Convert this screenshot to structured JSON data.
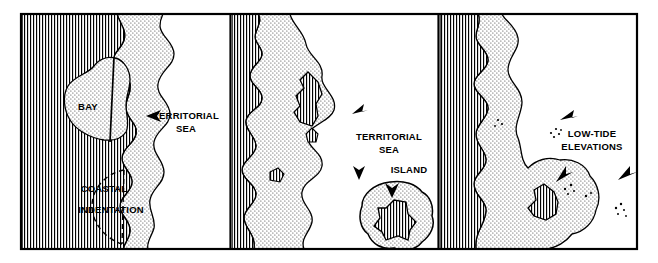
{
  "figure": {
    "frame": {
      "x": 20,
      "y": 13,
      "width": 618,
      "height": 237,
      "border_color": "#000000",
      "border_width": 2
    },
    "dividers": [
      230,
      438
    ],
    "colors": {
      "land_hatch": "#000000",
      "land_fill": "#ffffff",
      "sea_stipple": "#000000",
      "sea_fill": "#ffffff",
      "outline": "#000000",
      "arrow": "#000000",
      "background": "#ffffff"
    },
    "patterns": {
      "land": "vertical-line-hatch",
      "territorial_sea": "fine-dot-stipple",
      "open_water": "blank-white"
    }
  },
  "panels": [
    {
      "id": "panel-bay",
      "index": 1,
      "x": 22,
      "width": 208,
      "labels": [
        {
          "name": "bay-label",
          "text": "BAY",
          "x": 88,
          "y": 107,
          "anchor": "middle",
          "size": 9
        },
        {
          "name": "territorial-sea-label-line1",
          "text": "TERRITORIAL",
          "x": 186,
          "y": 119,
          "anchor": "middle",
          "size": 9
        },
        {
          "name": "territorial-sea-label-line2",
          "text": "SEA",
          "x": 186,
          "y": 133,
          "anchor": "middle",
          "size": 9
        },
        {
          "name": "coastal-indentation-label-line1",
          "text": "COASTAL",
          "x": 104,
          "y": 191,
          "anchor": "middle",
          "size": 9
        },
        {
          "name": "coastal-indentation-label-line2",
          "text": "INDENTATION",
          "x": 111,
          "y": 212,
          "anchor": "middle",
          "size": 9
        }
      ],
      "arrows": [
        {
          "name": "territorial-sea-arrow",
          "tip_x": 146,
          "tip_y": 116,
          "direction": "left"
        }
      ],
      "features": [
        "land",
        "bay-closing-line",
        "coastal-indentation-dashed-arc",
        "territorial-sea-belt"
      ]
    },
    {
      "id": "panel-island",
      "index": 2,
      "x": 232,
      "width": 206,
      "labels": [
        {
          "name": "territorial-sea-label-line1",
          "text": "TERRITORIAL",
          "x": 389,
          "y": 138,
          "anchor": "middle",
          "size": 9
        },
        {
          "name": "territorial-sea-label-line2",
          "text": "SEA",
          "x": 389,
          "y": 152,
          "anchor": "middle",
          "size": 9
        },
        {
          "name": "island-label",
          "text": "ISLAND",
          "x": 409,
          "y": 174,
          "anchor": "middle",
          "size": 9
        }
      ],
      "arrows": [
        {
          "name": "territorial-sea-arrow",
          "tip_x": 354,
          "tip_y": 116,
          "direction": "upper-left"
        },
        {
          "name": "island-territorial-sea-arrow",
          "tip_x": 359,
          "tip_y": 178,
          "direction": "down"
        },
        {
          "name": "island-pointer-arrow",
          "tip_x": 392,
          "tip_y": 196,
          "direction": "down"
        }
      ],
      "features": [
        "land",
        "territorial-sea-belt",
        "enclosed-lagoon-land",
        "small-islets",
        "offshore-island"
      ]
    },
    {
      "id": "panel-low-tide",
      "index": 3,
      "x": 440,
      "width": 196,
      "labels": [
        {
          "name": "low-tide-elevations-label-line1",
          "text": "LOW-TIDE",
          "x": 592,
          "y": 136,
          "anchor": "middle",
          "size": 9
        },
        {
          "name": "low-tide-elevations-label-line2",
          "text": "ELEVATIONS",
          "x": 592,
          "y": 150,
          "anchor": "middle",
          "size": 9
        }
      ],
      "arrows": [
        {
          "name": "low-tide-arrow-upper",
          "tip_x": 562,
          "tip_y": 118,
          "direction": "upper-left"
        },
        {
          "name": "low-tide-arrow-middle",
          "tip_x": 556,
          "tip_y": 178,
          "direction": "down-left"
        },
        {
          "name": "low-tide-arrow-right",
          "tip_x": 621,
          "tip_y": 178,
          "direction": "down-right"
        }
      ],
      "features": [
        "land",
        "territorial-sea-belt",
        "low-tide-elevation-dot-clusters",
        "enclosed-land-islet"
      ]
    }
  ]
}
